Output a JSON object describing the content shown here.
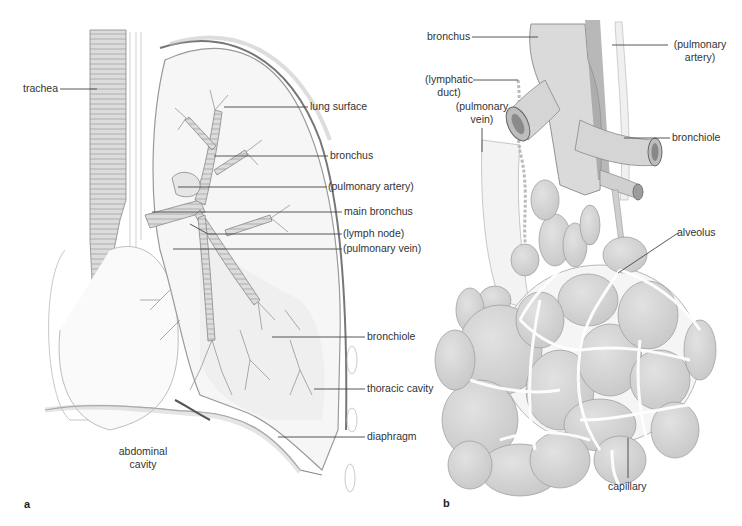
{
  "figure": {
    "panels": [
      {
        "id": "a",
        "letter": "a",
        "labels": {
          "trachea": "trachea",
          "lung_surface": "lung surface",
          "bronchus": "bronchus",
          "pulmonary_artery": "(pulmonary artery)",
          "main_bronchus": "main bronchus",
          "lymph_node": "(lymph node)",
          "pulmonary_vein": "(pulmonary vein)",
          "bronchiole": "bronchiole",
          "thoracic_cavity": "thoracic cavity",
          "diaphragm": "diaphragm",
          "abdominal_cavity_line1": "abdominal",
          "abdominal_cavity_line2": "cavity"
        }
      },
      {
        "id": "b",
        "letter": "b",
        "labels": {
          "bronchus": "bronchus",
          "pulmonary_artery_line1": "(pulmonary",
          "pulmonary_artery_line2": "artery)",
          "lymphatic_duct_line1": "(lymphatic",
          "lymphatic_duct_line2": "duct)",
          "pulmonary_vein_line1": "(pulmonary",
          "pulmonary_vein_line2": "vein)",
          "bronchiole": "bronchiole",
          "alveolus": "alveolus",
          "capillary": "capillary"
        }
      }
    ],
    "colors": {
      "ink": "#555555",
      "tissue_fill": "#d6d6d6",
      "tissue_light": "#ececec",
      "leader": "#444444"
    }
  }
}
